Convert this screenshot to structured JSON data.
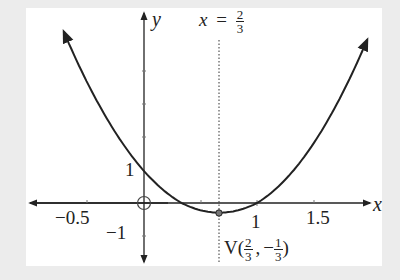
{
  "chart_data": {
    "type": "line",
    "title": "",
    "function": "y = 3x^2 - 4x + 1",
    "xlabel": "x",
    "ylabel": "y",
    "xlim": [
      -0.95,
      2.1
    ],
    "ylim": [
      -2.0,
      6.0
    ],
    "x_tick_labels": [
      "-0.5",
      "1",
      "1.5"
    ],
    "y_tick_labels": [
      "1",
      "-1"
    ],
    "grid": false,
    "series": [
      {
        "name": "parabola",
        "x": [
          -0.7,
          -0.5,
          0,
          0.3333,
          0.6667,
          1,
          1.5,
          1.97
        ],
        "y": [
          5.27,
          3.75,
          1,
          0,
          -0.3333,
          0,
          1.75,
          4.76
        ]
      }
    ],
    "annotations": {
      "axis_of_symmetry": {
        "label": "x = 2/3",
        "x": 0.6667
      },
      "vertex": {
        "label": "V(2/3, -1/3)",
        "x": 0.6667,
        "y": -0.3333
      },
      "origin_marker": "open circle at (0,0)"
    }
  },
  "labels": {
    "x_axis": "x",
    "y_axis": "y",
    "sym_x": "x",
    "sym_eq": "=",
    "sym_num": "2",
    "sym_den": "3",
    "tick_neg_half": "−0.5",
    "tick_one_x": "1",
    "tick_one_half": "1.5",
    "tick_one_y": "1",
    "tick_neg_one_y": "−1",
    "vertex_V": "V(",
    "vertex_num1": "2",
    "vertex_den1": "3",
    "vertex_comma": ",",
    "vertex_minus": "−",
    "vertex_num2": "1",
    "vertex_den2": "3",
    "vertex_close": ")"
  },
  "colors": {
    "background": "#ececec",
    "panel": "#ffffff",
    "ink": "#222222"
  }
}
